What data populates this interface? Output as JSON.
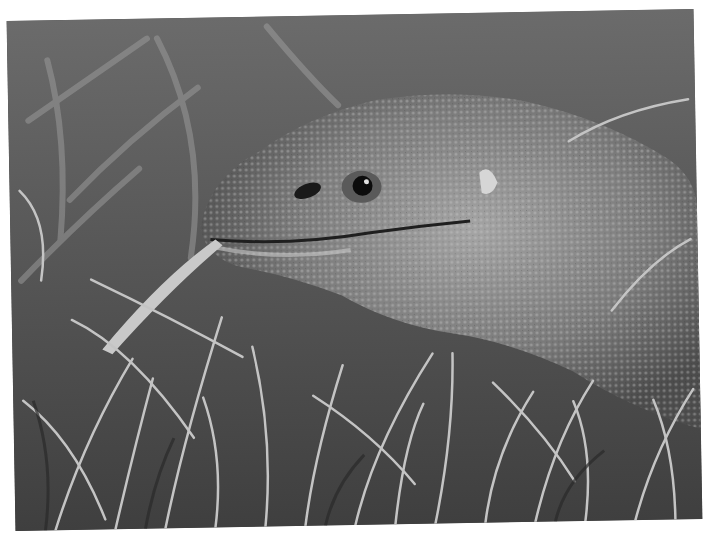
{
  "image": {
    "subject": "monitor lizard in grass",
    "style": "black and white photograph",
    "alt": "Close-up of a monitor lizard's head with a blade of grass at its mouth, surrounded by tall grass"
  },
  "colors": {
    "background": "#ffffff",
    "grass_light": "#bdbdbd",
    "grass_dark": "#2e2e2e",
    "lizard_body": "#7c7c7c",
    "lizard_highlight": "#a8a8a8",
    "eye": "#0c0c0c"
  }
}
